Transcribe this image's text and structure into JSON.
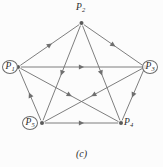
{
  "figure": {
    "caption": "(c)",
    "stroke_color": "#6f6f6f",
    "node_color": "#5a5a5a",
    "background_color": "#fcfcfc",
    "label_color": "#2b2b2b"
  },
  "graph": {
    "type": "directed-graph",
    "layout": "pentagon",
    "nodes": [
      {
        "id": "P1",
        "label": "P",
        "subscript": "1",
        "x": 18,
        "y": 67,
        "circled": true,
        "label_dx": -18,
        "label_dy": -7
      },
      {
        "id": "P2",
        "label": "P",
        "subscript": "2",
        "x": 81.5,
        "y": 23,
        "circled": false,
        "label_dx": -4,
        "label_dy": -18
      },
      {
        "id": "P3",
        "label": "P",
        "subscript": "3",
        "x": 145,
        "y": 67,
        "circled": true,
        "label_dx": 3,
        "label_dy": -7
      },
      {
        "id": "P4",
        "label": "P",
        "subscript": "4",
        "x": 121,
        "y": 123,
        "circled": false,
        "label_dx": 4,
        "label_dy": -2
      },
      {
        "id": "P5",
        "label": "P",
        "subscript": "5",
        "x": 42,
        "y": 123,
        "circled": true,
        "label_dx": -19,
        "label_dy": -3
      }
    ],
    "edges": [
      {
        "from": "P1",
        "to": "P2",
        "kind": "side"
      },
      {
        "from": "P2",
        "to": "P3",
        "kind": "side"
      },
      {
        "from": "P3",
        "to": "P4",
        "kind": "side"
      },
      {
        "from": "P5",
        "to": "P4",
        "kind": "side"
      },
      {
        "from": "P5",
        "to": "P1",
        "kind": "side"
      },
      {
        "from": "P1",
        "to": "P3",
        "kind": "diagonal"
      },
      {
        "from": "P2",
        "to": "P4",
        "kind": "diagonal"
      },
      {
        "from": "P2",
        "to": "P5",
        "kind": "diagonal"
      },
      {
        "from": "P3",
        "to": "P5",
        "kind": "diagonal"
      },
      {
        "from": "P1",
        "to": "P4",
        "kind": "diagonal"
      }
    ]
  }
}
